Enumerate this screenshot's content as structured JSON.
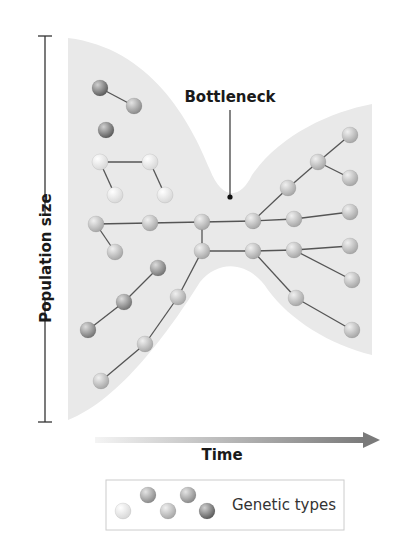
{
  "figure": {
    "bottleneck_label": "Bottleneck",
    "y_axis_label": "Population size",
    "x_axis_label": "Time",
    "legend_label": "Genetic types"
  },
  "colors": {
    "population_fill": "#e9e9e9",
    "edge": "#555555",
    "axis": "#333333",
    "arrow_start": "#f2f2f2",
    "arrow_end": "#7a7a7a",
    "legend_border": "#cccccc"
  },
  "genetic_types": [
    {
      "name": "light",
      "color": "#ececec"
    },
    {
      "name": "medium-light",
      "color": "#bdbdbd"
    },
    {
      "name": "medium",
      "color": "#a5a5a5"
    },
    {
      "name": "medium-dark",
      "color": "#8f8f8f"
    },
    {
      "name": "dark",
      "color": "#7b7b7b"
    }
  ],
  "nodes": [
    {
      "id": "n1",
      "x": 100,
      "y": 88,
      "type": "dark"
    },
    {
      "id": "n2",
      "x": 134,
      "y": 106,
      "type": "medium"
    },
    {
      "id": "n3",
      "x": 106,
      "y": 130,
      "type": "dark"
    },
    {
      "id": "n4",
      "x": 100,
      "y": 162,
      "type": "light"
    },
    {
      "id": "n5",
      "x": 150,
      "y": 162,
      "type": "light"
    },
    {
      "id": "n6",
      "x": 115,
      "y": 195,
      "type": "light"
    },
    {
      "id": "n7",
      "x": 165,
      "y": 195,
      "type": "light"
    },
    {
      "id": "n8",
      "x": 96,
      "y": 224,
      "type": "medium-light"
    },
    {
      "id": "n9",
      "x": 150,
      "y": 223,
      "type": "medium-light"
    },
    {
      "id": "n10",
      "x": 202,
      "y": 222,
      "type": "medium-light"
    },
    {
      "id": "n11",
      "x": 253,
      "y": 221,
      "type": "medium-light"
    },
    {
      "id": "n12",
      "x": 294,
      "y": 219,
      "type": "medium-light"
    },
    {
      "id": "n13",
      "x": 350,
      "y": 212,
      "type": "medium-light"
    },
    {
      "id": "n14",
      "x": 115,
      "y": 252,
      "type": "medium-light"
    },
    {
      "id": "n15",
      "x": 288,
      "y": 188,
      "type": "medium-light"
    },
    {
      "id": "n16",
      "x": 318,
      "y": 162,
      "type": "medium-light"
    },
    {
      "id": "n17",
      "x": 350,
      "y": 135,
      "type": "medium-light"
    },
    {
      "id": "n18",
      "x": 350,
      "y": 178,
      "type": "medium-light"
    },
    {
      "id": "n19",
      "x": 202,
      "y": 251,
      "type": "medium-light"
    },
    {
      "id": "n20",
      "x": 253,
      "y": 251,
      "type": "medium-light"
    },
    {
      "id": "n21",
      "x": 294,
      "y": 250,
      "type": "medium-light"
    },
    {
      "id": "n22",
      "x": 350,
      "y": 246,
      "type": "medium-light"
    },
    {
      "id": "n23",
      "x": 352,
      "y": 280,
      "type": "medium-light"
    },
    {
      "id": "n24",
      "x": 296,
      "y": 298,
      "type": "medium-light"
    },
    {
      "id": "n25",
      "x": 352,
      "y": 330,
      "type": "medium-light"
    },
    {
      "id": "n26",
      "x": 178,
      "y": 297,
      "type": "medium-light"
    },
    {
      "id": "n27",
      "x": 145,
      "y": 344,
      "type": "medium-light"
    },
    {
      "id": "n28",
      "x": 101,
      "y": 381,
      "type": "medium-light"
    },
    {
      "id": "n29",
      "x": 158,
      "y": 268,
      "type": "medium-dark"
    },
    {
      "id": "n30",
      "x": 124,
      "y": 302,
      "type": "medium-dark"
    },
    {
      "id": "n31",
      "x": 88,
      "y": 330,
      "type": "medium-dark"
    }
  ],
  "edges": [
    [
      "n1",
      "n2"
    ],
    [
      "n4",
      "n5"
    ],
    [
      "n4",
      "n6"
    ],
    [
      "n5",
      "n7"
    ],
    [
      "n8",
      "n9"
    ],
    [
      "n9",
      "n10"
    ],
    [
      "n10",
      "n11"
    ],
    [
      "n11",
      "n12"
    ],
    [
      "n12",
      "n13"
    ],
    [
      "n8",
      "n14"
    ],
    [
      "n11",
      "n15"
    ],
    [
      "n15",
      "n16"
    ],
    [
      "n16",
      "n17"
    ],
    [
      "n16",
      "n18"
    ],
    [
      "n10",
      "n19"
    ],
    [
      "n19",
      "n20"
    ],
    [
      "n20",
      "n21"
    ],
    [
      "n21",
      "n22"
    ],
    [
      "n21",
      "n23"
    ],
    [
      "n20",
      "n24"
    ],
    [
      "n24",
      "n25"
    ],
    [
      "n19",
      "n26"
    ],
    [
      "n26",
      "n27"
    ],
    [
      "n27",
      "n28"
    ],
    [
      "n29",
      "n30"
    ],
    [
      "n30",
      "n31"
    ]
  ],
  "legend_swatches": [
    {
      "x": 123,
      "y": 511,
      "type": "light"
    },
    {
      "x": 148,
      "y": 495,
      "type": "medium"
    },
    {
      "x": 168,
      "y": 511,
      "type": "medium-light"
    },
    {
      "x": 188,
      "y": 495,
      "type": "medium"
    },
    {
      "x": 207,
      "y": 511,
      "type": "dark"
    }
  ]
}
